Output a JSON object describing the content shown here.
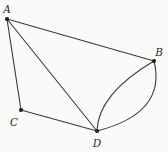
{
  "diagram": {
    "type": "geometry-figure",
    "background": "#fafaf9",
    "stroke_color": "#3a3a3a",
    "dot_color": "#1f1f1f",
    "label_color": "#2b2b2b",
    "stroke_width": 1.1,
    "dot_radius": 2.1,
    "points": {
      "A": {
        "label": "A",
        "x": 7,
        "y": 19,
        "label_x": 7,
        "label_y": 13
      },
      "B": {
        "label": "B",
        "x": 154,
        "y": 61,
        "label_x": 159,
        "label_y": 56
      },
      "C": {
        "label": "C",
        "x": 21,
        "y": 110,
        "label_x": 14,
        "label_y": 126
      },
      "D": {
        "label": "D",
        "x": 97,
        "y": 131,
        "label_x": 97,
        "label_y": 147
      }
    },
    "segments": [
      {
        "name": "edge-AB",
        "from": "A",
        "to": "B"
      },
      {
        "name": "edge-AC",
        "from": "A",
        "to": "C"
      },
      {
        "name": "edge-AD",
        "from": "A",
        "to": "D"
      },
      {
        "name": "edge-CD",
        "from": "C",
        "to": "D"
      }
    ],
    "arcs": [
      {
        "name": "arc-BD-inner",
        "from": "B",
        "to": "D",
        "ctrl_x": 98,
        "ctrl_y": 94
      },
      {
        "name": "arc-BD-outer",
        "from": "B",
        "to": "D",
        "ctrl_x": 167,
        "ctrl_y": 113
      }
    ]
  }
}
